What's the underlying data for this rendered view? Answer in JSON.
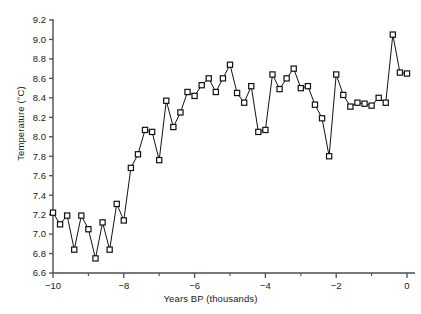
{
  "chart_data": {
    "type": "line",
    "title": "",
    "xlabel": "Years BP (thousands)",
    "ylabel": "Temperature (°C)",
    "xlim": [
      -10.1,
      0.1
    ],
    "ylim": [
      6.6,
      9.2
    ],
    "grid": false,
    "legend": null,
    "marker": "open-square",
    "line_color": "#111111",
    "marker_face_color": "#ffffff",
    "marker_edge_color": "#111111",
    "xticks": [
      -10,
      -8,
      -6,
      -4,
      -2,
      0
    ],
    "xtick_labels": [
      "−10",
      "−8",
      "−6",
      "−4",
      "−2",
      "0"
    ],
    "xminorticks": [
      -9,
      -7,
      -5,
      -3,
      -1
    ],
    "yticks": [
      6.6,
      6.8,
      7.0,
      7.2,
      7.4,
      7.6,
      7.8,
      8.0,
      8.2,
      8.4,
      8.6,
      8.8,
      9.0,
      9.2
    ],
    "ytick_labels": [
      "6.6",
      "6.8",
      "7.0",
      "7.2",
      "7.4",
      "7.6",
      "7.8",
      "8.0",
      "8.2",
      "8.4",
      "8.6",
      "8.8",
      "9.0",
      "9.2"
    ],
    "series": [
      {
        "name": "Reconstructed temperature",
        "x": [
          -10.0,
          -9.8,
          -9.6,
          -9.4,
          -9.2,
          -9.0,
          -8.8,
          -8.6,
          -8.4,
          -8.2,
          -8.0,
          -7.8,
          -7.6,
          -7.4,
          -7.2,
          -7.0,
          -6.8,
          -6.6,
          -6.4,
          -6.2,
          -6.0,
          -5.8,
          -5.6,
          -5.4,
          -5.2,
          -5.0,
          -4.8,
          -4.6,
          -4.4,
          -4.2,
          -4.0,
          -3.8,
          -3.6,
          -3.4,
          -3.2,
          -3.0,
          -2.8,
          -2.6,
          -2.4,
          -2.2,
          -2.0,
          -1.8,
          -1.6,
          -1.4,
          -1.2,
          -1.0,
          -0.8,
          -0.6,
          -0.4,
          -0.2,
          0.0
        ],
        "values": [
          7.22,
          7.1,
          7.19,
          6.84,
          7.19,
          7.05,
          6.75,
          7.12,
          6.84,
          7.31,
          7.14,
          7.68,
          7.82,
          8.07,
          8.05,
          7.76,
          8.37,
          8.1,
          8.25,
          8.46,
          8.42,
          8.53,
          8.6,
          8.46,
          8.6,
          8.74,
          8.45,
          8.35,
          8.52,
          8.05,
          8.07,
          8.64,
          8.49,
          8.6,
          8.7,
          8.5,
          8.52,
          8.33,
          8.19,
          7.8,
          8.64,
          8.43,
          8.31,
          8.35,
          8.34,
          8.32,
          8.4,
          8.35,
          9.05,
          8.66,
          8.65
        ]
      }
    ]
  },
  "axes": {
    "x_title": "Years BP (thousands)",
    "y_title": "Temperature (°C)"
  }
}
